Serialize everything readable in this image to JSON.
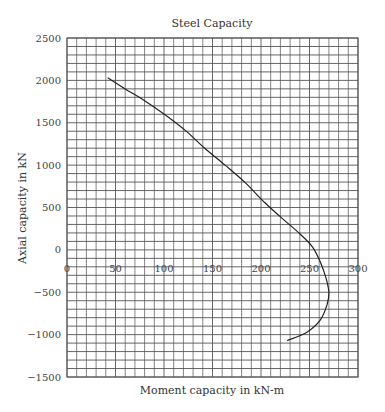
{
  "chart_data": {
    "type": "line",
    "title": "Steel Capacity",
    "xlabel": "Moment capacity in kN-m",
    "ylabel": "Axial capacity in kN",
    "xlim": [
      0,
      300
    ],
    "ylim": [
      -1500,
      2500
    ],
    "x_ticks": [
      0,
      50,
      100,
      150,
      200,
      250,
      300
    ],
    "y_ticks": [
      2500,
      2000,
      1500,
      1000,
      500,
      0,
      -500,
      -1000,
      -1500
    ],
    "x_tick_labels": [
      "0",
      "50",
      "100",
      "150",
      "200",
      "250",
      "300"
    ],
    "y_tick_labels": [
      "2500",
      "2000",
      "1500",
      "1000",
      "500",
      "0",
      "−500",
      "−1000",
      "−1500"
    ],
    "grid": true,
    "grid_x_step": 10,
    "grid_y_step": 100,
    "legend": null,
    "series": [
      {
        "name": "Steel Capacity",
        "color": "#222222",
        "x": [
          42,
          60,
          80,
          101,
          122,
          142,
          163,
          184,
          204,
          225,
          240,
          253,
          261,
          267,
          270,
          268,
          261,
          247,
          227
        ],
        "y": [
          2030,
          1900,
          1760,
          1595,
          1410,
          1200,
          1000,
          790,
          555,
          340,
          190,
          35,
          -140,
          -330,
          -500,
          -650,
          -830,
          -975,
          -1070
        ]
      }
    ]
  }
}
